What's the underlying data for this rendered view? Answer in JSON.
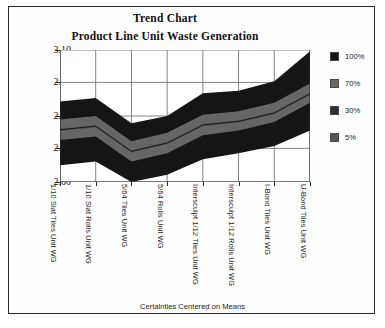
{
  "titles": {
    "main": "Trend Chart",
    "sub": "Product Line Unit Waste Generation"
  },
  "axis": {
    "x_title": "Certainties Centered on Means"
  },
  "legend": {
    "items": [
      {
        "label": "100%",
        "color": "#151515"
      },
      {
        "label": "70%",
        "color": "#666666"
      },
      {
        "label": "30%",
        "color": "#2e2e2e"
      },
      {
        "label": "5%",
        "color": "#555555"
      }
    ]
  },
  "caption": "",
  "chart_data": {
    "type": "area",
    "title": "Product Line Unit Waste Generation",
    "subtitle": "Trend Chart",
    "xlabel": "Certainties Centered on Means",
    "ylabel": "",
    "ylim": [
      2.0,
      3.1
    ],
    "yticks": [
      2.0,
      2.28,
      2.55,
      2.83,
      3.1
    ],
    "ytick_labels": [
      "2.00",
      "2.28",
      "2.55",
      "2.83",
      "3.10"
    ],
    "grid": true,
    "legend_position": "right",
    "categories": [
      "1/10 Slat Tiles Unit WG",
      "1/10 Slat Rolls Unit WG",
      "5/64 Tiles Unit WG",
      "5/64 Rolls Unit WG",
      "Intersculpt 1/12 Tiles Unit WG",
      "Intersculpt 1/12 Rolls Unit WG",
      "I-Bond Tiles Unit WG",
      "U-Bond Tiles Unit WG"
    ],
    "bands": [
      {
        "name": "100%",
        "color": "#151515",
        "upper": [
          2.67,
          2.7,
          2.49,
          2.55,
          2.74,
          2.76,
          2.84,
          3.09
        ],
        "lower": [
          2.14,
          2.17,
          2.0,
          2.06,
          2.19,
          2.24,
          2.3,
          2.43
        ]
      },
      {
        "name": "30%",
        "color": "#2e2e2e",
        "upper": [
          2.5,
          2.53,
          2.32,
          2.39,
          2.54,
          2.57,
          2.64,
          2.8
        ],
        "lower": [
          2.37,
          2.4,
          2.19,
          2.26,
          2.41,
          2.45,
          2.52,
          2.68
        ]
      },
      {
        "name": "70%",
        "color": "#666666",
        "upper": [
          2.52,
          2.55,
          2.34,
          2.41,
          2.56,
          2.59,
          2.66,
          2.82
        ],
        "lower": [
          2.35,
          2.38,
          2.17,
          2.24,
          2.39,
          2.43,
          2.5,
          2.66
        ]
      },
      {
        "name": "5%",
        "color": "#555555",
        "upper": [
          2.445,
          2.475,
          2.265,
          2.335,
          2.485,
          2.515,
          2.585,
          2.745
        ],
        "lower": [
          2.425,
          2.455,
          2.245,
          2.315,
          2.465,
          2.495,
          2.565,
          2.725
        ]
      }
    ],
    "mean": [
      2.435,
      2.465,
      2.255,
      2.325,
      2.475,
      2.505,
      2.575,
      2.735
    ]
  }
}
